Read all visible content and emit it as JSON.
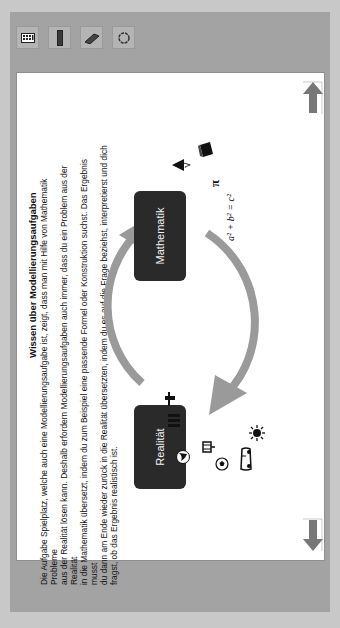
{
  "toolbar": {
    "items": [
      {
        "name": "keyboard-icon",
        "glyph": "▦"
      },
      {
        "name": "marker-icon",
        "glyph": "▮"
      },
      {
        "name": "eraser-icon",
        "glyph": "✎"
      },
      {
        "name": "lasso-icon",
        "glyph": "◯"
      }
    ]
  },
  "content": {
    "title": "Wissen über Modellierungsaufgaben",
    "paragraph_lines": [
      "Die Aufgabe Spielplatz, welche auch eine Modellierungsaufgabe ist, zeigt, dass man mit Hilfe von Mathematik Probleme",
      "aus der Realität lösen kann. Deshalb erfordern Modellierungsaufgaben auch immer, dass du ein Problem aus der Realität",
      "in die Mathematik übersetzt, indem du zum Beispiel eine passende Formel oder Konstruktion suchst. Das Ergebnis musst",
      "du dann am Ende wieder zurück in die Realität übersetzten, indem du es auf die Frage beziehst, interpretierst und dich",
      "fragst, ob das Ergebnis realistisch ist."
    ]
  },
  "diagram": {
    "box_reality": "Realität",
    "box_math": "Mathematik",
    "formula": "a² + b² = c²",
    "pi": "π",
    "sqrt": "√",
    "reality_icons": [
      "globe-icon",
      "books-icon",
      "tower-icon",
      "shopping-cart-icon",
      "soccer-ball-icon",
      "car-icon",
      "sun-icon"
    ],
    "math_icons": [
      "triangle-icon",
      "sqrt-icon",
      "cube-icon",
      "pi-icon",
      "formula"
    ],
    "arrow_color": "#9a9a9a",
    "box_color": "#2a2a2a"
  },
  "navigation": {
    "prev": "previous-page",
    "next": "next-page",
    "arrow_color": "#7a7a7a"
  }
}
